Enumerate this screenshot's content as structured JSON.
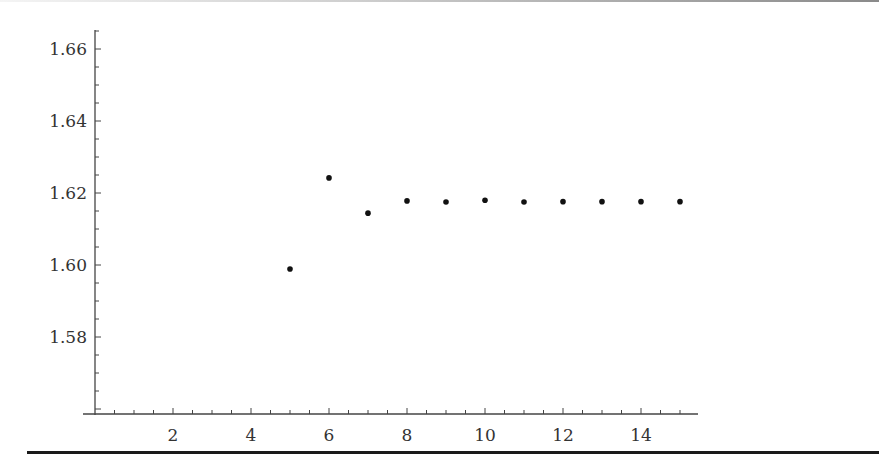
{
  "chart_data": {
    "type": "scatter",
    "title": "",
    "xlabel": "",
    "ylabel": "",
    "x": [
      5,
      6,
      7,
      8,
      9,
      10,
      11,
      12,
      13,
      14,
      15
    ],
    "y": [
      1.5989,
      1.6242,
      1.6144,
      1.6178,
      1.6175,
      1.618,
      1.6175,
      1.6176,
      1.6176,
      1.6176,
      1.6176
    ],
    "xlim": [
      0,
      15.4
    ],
    "ylim": [
      1.558,
      1.665
    ],
    "x_ticks": [
      2,
      4,
      6,
      8,
      10,
      12,
      14
    ],
    "x_tick_labels": [
      "2",
      "4",
      "6",
      "8",
      "10",
      "12",
      "14"
    ],
    "y_ticks": [
      1.58,
      1.6,
      1.62,
      1.64,
      1.66
    ],
    "y_tick_labels": [
      "1.58",
      "1.60",
      "1.62",
      "1.64",
      "1.66"
    ],
    "grid": false,
    "legend": null,
    "marker_color": "#111111"
  }
}
